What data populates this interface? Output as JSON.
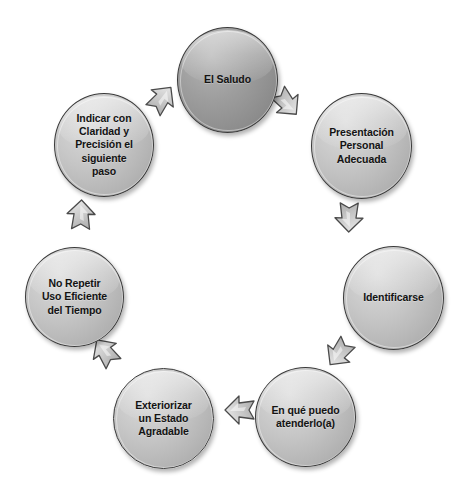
{
  "diagram": {
    "type": "cycle",
    "background_color": "#ffffff",
    "node_fill_light": "#bdbdbd",
    "node_fill_dark": "#9a9a9a",
    "node_border_color": "#3a3a3a",
    "arrow_fill": "#c9c9c9",
    "arrow_border_color": "#4a4a4a",
    "text_color": "#131313",
    "direction": "clockwise",
    "step_count": 7,
    "steps": [
      {
        "index": 1,
        "label": "El Saludo",
        "lines": [
          "El Saludo"
        ],
        "emphasis": "dark"
      },
      {
        "index": 2,
        "label": "Presentación Personal Adecuada",
        "lines": [
          "Presentación",
          "Personal",
          "Adecuada"
        ],
        "emphasis": "light"
      },
      {
        "index": 3,
        "label": "Identificarse",
        "lines": [
          "Identificarse"
        ],
        "emphasis": "light"
      },
      {
        "index": 4,
        "label": "En qué puedo atenderlo(a)",
        "lines": [
          "En qué puedo",
          "atenderlo(a)"
        ],
        "emphasis": "light"
      },
      {
        "index": 5,
        "label": "Exteriorizar un Estado Agradable",
        "lines": [
          "Exteriorizar",
          "un Estado",
          "Agradable"
        ],
        "emphasis": "light"
      },
      {
        "index": 6,
        "label": "No Repetir Uso Eficiente del Tiempo",
        "lines": [
          "No Repetir",
          "Uso Eficiente",
          "del Tiempo"
        ],
        "emphasis": "light"
      },
      {
        "index": 7,
        "label": "Indicar con Claridad y Precisión el siguiente paso",
        "lines": [
          "Indicar con",
          "Claridad y",
          "Precisión el",
          "siguiente",
          "paso"
        ],
        "emphasis": "light"
      }
    ],
    "connectors": [
      {
        "from": "El Saludo",
        "to": "Presentación Personal Adecuada",
        "icon": "block-arrow-icon"
      },
      {
        "from": "Presentación Personal Adecuada",
        "to": "Identificarse",
        "icon": "block-arrow-icon"
      },
      {
        "from": "Identificarse",
        "to": "En qué puedo atenderlo(a)",
        "icon": "block-arrow-icon"
      },
      {
        "from": "En qué puedo atenderlo(a)",
        "to": "Exteriorizar un Estado Agradable",
        "icon": "block-arrow-icon"
      },
      {
        "from": "Exteriorizar un Estado Agradable",
        "to": "No Repetir Uso Eficiente del Tiempo",
        "icon": "block-arrow-icon"
      },
      {
        "from": "No Repetir Uso Eficiente del Tiempo",
        "to": "Indicar con Claridad y Precisión el siguiente paso",
        "icon": "block-arrow-icon"
      },
      {
        "from": "Indicar con Claridad y Precisión el siguiente paso",
        "to": "El Saludo",
        "icon": "block-arrow-icon"
      }
    ]
  }
}
